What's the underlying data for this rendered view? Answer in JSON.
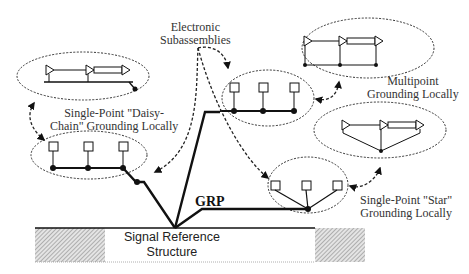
{
  "diagram": {
    "labels": {
      "electronic_subassemblies": [
        "Electronic",
        "Subassemblies"
      ],
      "daisy_chain": [
        "Single-Point \"Daisy-",
        "Chain\" Grounding Locally"
      ],
      "multipoint": [
        "Multipoint",
        "Grounding Locally"
      ],
      "star": [
        "Single-Point \"Star\"",
        "Grounding Locally"
      ],
      "grp": "GRP",
      "signal_reference": [
        "Signal Reference",
        "Structure"
      ]
    },
    "groups": [
      {
        "id": "daisy-chain",
        "subassemblies": 3,
        "topology": "daisy-chain"
      },
      {
        "id": "multipoint",
        "subassemblies": 3,
        "topology": "multipoint"
      },
      {
        "id": "star",
        "subassemblies": 3,
        "topology": "star"
      }
    ],
    "colors": {
      "line": "#111111",
      "dash": "#333333",
      "hatch": "#9a9a9a"
    }
  }
}
